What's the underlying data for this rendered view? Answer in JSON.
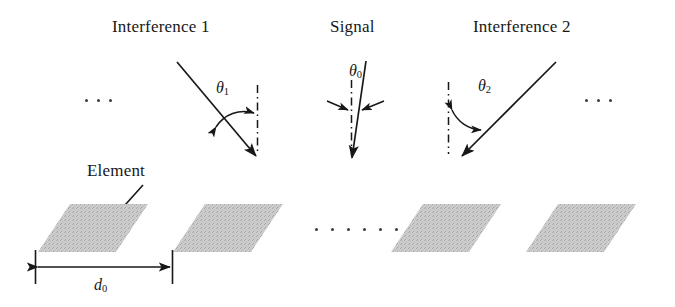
{
  "figure": {
    "type": "antenna-array-geometry-diagram",
    "background_color": "#ffffff",
    "ink_color": "#171717",
    "element_fill_color": "#c9c9c9"
  },
  "labels": {
    "interference_1": "Interference 1",
    "signal": "Signal",
    "interference_2": "Interference 2",
    "element": "Element"
  },
  "angles": {
    "theta_1": {
      "symbol": "θ",
      "subscript": "1"
    },
    "theta_0": {
      "symbol": "θ",
      "subscript": "0"
    },
    "theta_2": {
      "symbol": "θ",
      "subscript": "2"
    }
  },
  "dimension": {
    "spacing": {
      "symbol": "d",
      "subscript": "0"
    }
  },
  "ellipses": {
    "left": [
      "dot",
      "dot",
      "dot"
    ],
    "right": [
      "dot",
      "dot",
      "dot"
    ],
    "middle": [
      "dot",
      "dot",
      "dot",
      "dot",
      "dot",
      "dot"
    ]
  },
  "array_elements": [
    {
      "name": "element-1"
    },
    {
      "name": "element-2"
    },
    {
      "name": "element-3"
    },
    {
      "name": "element-4"
    }
  ]
}
